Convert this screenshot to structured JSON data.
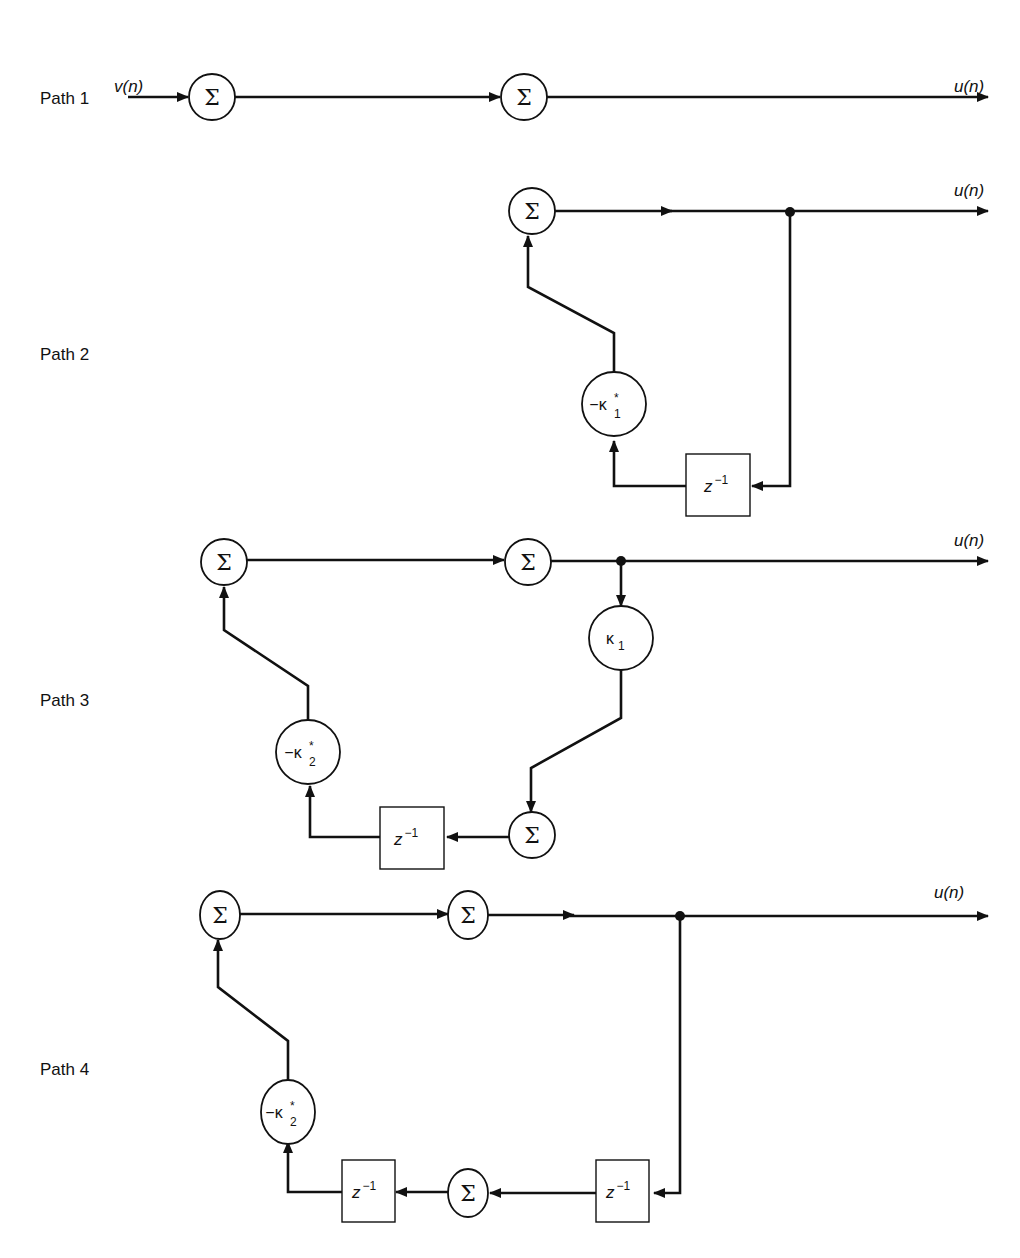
{
  "labels": {
    "input": "v(n)",
    "output": "u(n)",
    "sigma": "Σ",
    "delay": "z",
    "delay_exp": "−1"
  },
  "paths": [
    {
      "label": "Path 1"
    },
    {
      "label": "Path 2",
      "gain": {
        "prefix": "−κ",
        "sub": "1",
        "sup": "*"
      }
    },
    {
      "label": "Path 3",
      "gain_fwd": {
        "prefix": "κ",
        "sub": "1"
      },
      "gain": {
        "prefix": "−κ",
        "sub": "2",
        "sup": "*"
      }
    },
    {
      "label": "Path 4",
      "gain": {
        "prefix": "−κ",
        "sub": "2",
        "sup": "*"
      }
    }
  ]
}
